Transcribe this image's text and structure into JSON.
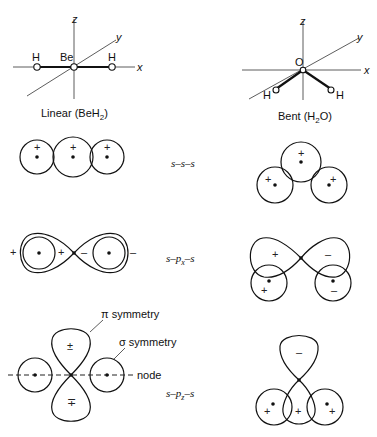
{
  "diagram": {
    "molecules": [
      {
        "name": "linear",
        "caption": "Linear (BeH",
        "caption_sub": "2",
        "caption_end": ")",
        "central_atom": "Be",
        "ligand_atom": "H",
        "axes": {
          "x": "x",
          "y": "y",
          "z": "z"
        }
      },
      {
        "name": "bent",
        "caption": "Bent (H",
        "caption_sub": "2",
        "caption_end": "O)",
        "central_atom": "O",
        "ligand_atom": "H",
        "axes": {
          "x": "x",
          "y": "y",
          "z": "z"
        }
      }
    ],
    "rows": [
      {
        "label": "s–s–s",
        "sub": ""
      },
      {
        "label_pre": "s–p",
        "sub": "x",
        "label_post": "–s"
      },
      {
        "label_pre": "s–p",
        "sub": "z",
        "label_post": "–s"
      }
    ],
    "signs": {
      "plus": "+",
      "minus": "–",
      "plus_over_minus": "±",
      "minus_over_plus": "∓"
    },
    "annotations": {
      "pi": "π symmetry",
      "sigma": "σ symmetry",
      "node": "node"
    }
  }
}
